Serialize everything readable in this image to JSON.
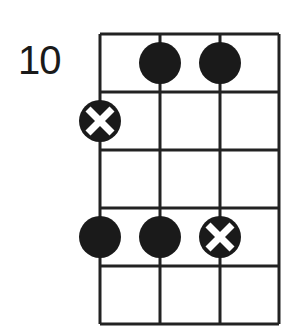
{
  "diagram": {
    "type": "bass-fretboard-diagram",
    "starting_fret_label": "10",
    "strings": 4,
    "frets_shown": 5,
    "grid": {
      "x": [
        100,
        160,
        220,
        279
      ],
      "y": [
        34,
        92,
        150,
        208,
        266,
        324
      ]
    },
    "colors": {
      "line": "#222222",
      "dot": "#1a1a1a",
      "x_mark": "#ffffff"
    },
    "notes": [
      {
        "string": 2,
        "fret": 1,
        "marker": "dot"
      },
      {
        "string": 3,
        "fret": 1,
        "marker": "dot"
      },
      {
        "string": 1,
        "fret": 2,
        "marker": "x-dot"
      },
      {
        "string": 1,
        "fret": 4,
        "marker": "dot"
      },
      {
        "string": 2,
        "fret": 4,
        "marker": "dot"
      },
      {
        "string": 3,
        "fret": 4,
        "marker": "x-dot"
      }
    ]
  }
}
